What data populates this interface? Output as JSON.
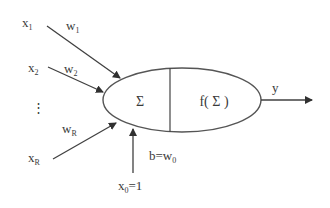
{
  "diagram": {
    "type": "perceptron-neuron",
    "inputs": [
      {
        "name": "x",
        "sub": "1",
        "weight": "w",
        "weight_sub": "1"
      },
      {
        "name": "x",
        "sub": "2",
        "weight": "w",
        "weight_sub": "2"
      },
      {
        "name": "x",
        "sub": "R",
        "weight": "w",
        "weight_sub": "R"
      }
    ],
    "ellipsis": "⋮",
    "bias": {
      "input_label": "x",
      "input_sub": "0",
      "input_value": "=1",
      "bias_label": "b=w",
      "bias_sub": "0"
    },
    "summation_label": "Σ",
    "activation_label": "f( Σ )",
    "output_label": "y",
    "colors": {
      "stroke": "#404040",
      "text": "#3a3a3a",
      "background": "#ffffff"
    }
  }
}
